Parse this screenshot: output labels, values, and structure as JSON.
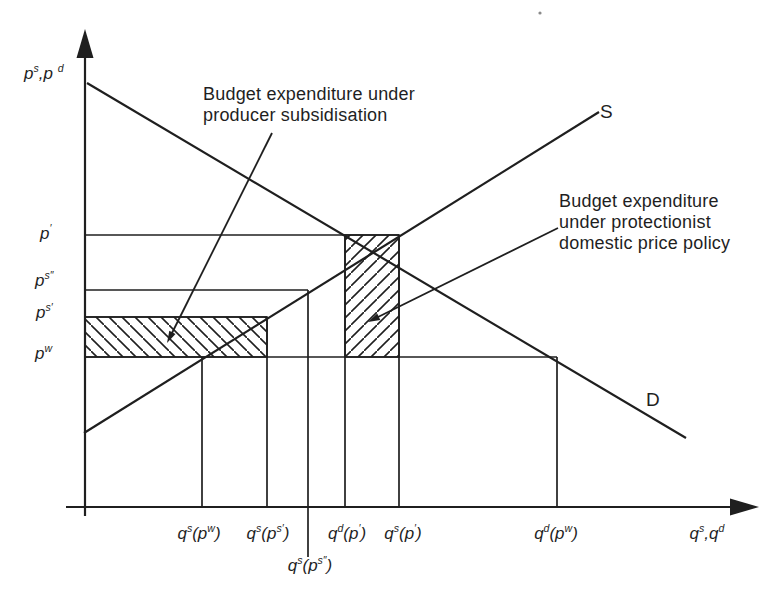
{
  "figure": {
    "axis": {
      "y_label": "p^s,p ^d",
      "x_label": "q^s,q^d"
    },
    "curves": {
      "supply_label": "S",
      "demand_label": "D"
    },
    "price_ticks": [
      {
        "name": "p-prime",
        "label": "p^{′}"
      },
      {
        "name": "p-s-double-prime",
        "label": "p^{s″}"
      },
      {
        "name": "p-s-prime",
        "label": "p^{s′}"
      },
      {
        "name": "p-world",
        "label": "p^w"
      }
    ],
    "quantity_ticks": [
      {
        "name": "qs-pw",
        "label": "q^s(p^w)"
      },
      {
        "name": "qs-ps-prime",
        "label": "q^s(p^{s′})"
      },
      {
        "name": "qs-ps-double-prime",
        "label": "q^s(p^{s″})"
      },
      {
        "name": "qd-p-prime",
        "label": "q^d(p^{′})"
      },
      {
        "name": "qs-p-prime",
        "label": "q^s(p^{′})"
      },
      {
        "name": "qd-pw",
        "label": "q^d(p^w)"
      }
    ],
    "annotations": {
      "subsidy": {
        "line1": "Budget expenditure under",
        "line2": "producer subsidisation"
      },
      "protection": {
        "line1": "Budget expenditure",
        "line2": "under protectionist",
        "line3": "domestic price policy"
      }
    },
    "hatched_regions": [
      {
        "name": "subsidy-expenditure-area",
        "hatch": "backslash"
      },
      {
        "name": "protection-expenditure-area",
        "hatch": "forward-slash"
      }
    ],
    "colors": {
      "ink": "#1f1f1f",
      "paper": "#ffffff"
    }
  },
  "chart_data": {
    "type": "line",
    "title": "",
    "xlabel": "q^s,q^d",
    "ylabel": "p^s,p^d",
    "series": [
      {
        "name": "S",
        "shape": "straight upward-sloping supply curve from y-axis near bottom-left to upper-right"
      },
      {
        "name": "D",
        "shape": "straight downward-sloping demand curve from y-axis near top-left to lower-right"
      }
    ],
    "price_levels_top_to_bottom": [
      "p′",
      "pˢ″",
      "pˢ′",
      "pʷ"
    ],
    "quantity_marks_left_to_right": [
      "qˢ(pʷ)",
      "qˢ(pˢ′)",
      "qˢ(pˢ″)",
      "qᵈ(p′)",
      "qˢ(p′)",
      "qᵈ(pʷ)"
    ],
    "regions": [
      {
        "label": "Budget expenditure under producer subsidisation",
        "bounds": "between pˢ′ and pʷ, from price axis to qˢ(pˢ′)"
      },
      {
        "label": "Budget expenditure under protectionist domestic price policy",
        "bounds": "between p′ and pʷ, from qᵈ(p′) to qˢ(p′)"
      }
    ],
    "legend_position": "none",
    "grid": false
  }
}
